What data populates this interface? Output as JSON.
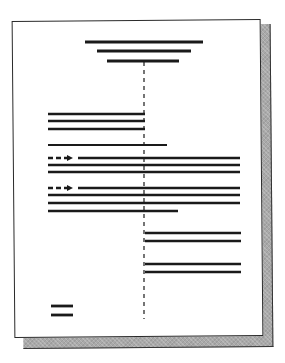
{
  "heading": {
    "text": ""
  },
  "document": {
    "title_lines": [
      {
        "x1": 85,
        "x2": 203,
        "y": 42
      },
      {
        "x1": 97,
        "x2": 191,
        "y": 51
      },
      {
        "x1": 107,
        "x2": 179,
        "y": 61
      }
    ],
    "center_divider": {
      "x": 144,
      "y1": 62,
      "y2": 319,
      "dash": "4 4"
    },
    "block_left": [
      {
        "x1": 48,
        "x2": 145,
        "y": 114
      },
      {
        "x1": 48,
        "x2": 145,
        "y": 121
      },
      {
        "x1": 48,
        "x2": 145,
        "y": 129
      }
    ],
    "single_line": {
      "x1": 48,
      "x2": 167,
      "y": 145
    },
    "paragraphs": [
      {
        "indent_arrow": {
          "x1": 48,
          "x2": 74,
          "y": 158
        },
        "lines": [
          {
            "x1": 78,
            "x2": 240,
            "y": 158
          },
          {
            "x1": 48,
            "x2": 240,
            "y": 165
          },
          {
            "x1": 48,
            "x2": 240,
            "y": 172
          }
        ]
      },
      {
        "indent_arrow": {
          "x1": 48,
          "x2": 74,
          "y": 188
        },
        "lines": [
          {
            "x1": 78,
            "x2": 240,
            "y": 188
          },
          {
            "x1": 48,
            "x2": 240,
            "y": 195
          },
          {
            "x1": 48,
            "x2": 240,
            "y": 203
          },
          {
            "x1": 48,
            "x2": 178,
            "y": 211
          }
        ]
      }
    ],
    "block_right": [
      {
        "x1": 145,
        "x2": 241,
        "y": 233
      },
      {
        "x1": 145,
        "x2": 241,
        "y": 241
      },
      {
        "x1": 145,
        "x2": 241,
        "y": 264
      },
      {
        "x1": 145,
        "x2": 241,
        "y": 272
      }
    ],
    "signature_lines": [
      {
        "x1": 51,
        "x2": 73,
        "y": 306
      },
      {
        "x1": 51,
        "x2": 73,
        "y": 315
      }
    ]
  },
  "colors": {
    "ink": "#1a1a1a",
    "shadow": "#a9a9a9",
    "page": "#ffffff"
  }
}
